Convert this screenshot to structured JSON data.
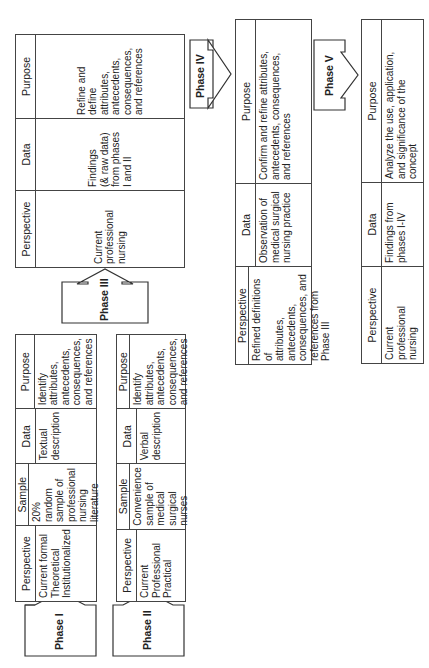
{
  "diagram": {
    "orientation": "rotated 90 degrees counter-clockwise",
    "phases": [
      {
        "label": "Phase I",
        "columns": [
          "Perspective",
          "Sample",
          "Data",
          "Purpose"
        ],
        "cells": [
          "Current formal\nTheoretical\nInstitutionalized",
          "20% random\nsample of\nprofessional\nnursing\nliterature",
          "Textual\ndescription",
          "Identify\nattributes,\nantecedents,\nconsequences,\nand references"
        ]
      },
      {
        "label": "Phase II",
        "columns": [
          "Perspective",
          "Sample",
          "Data",
          "Purpose"
        ],
        "cells": [
          "Current\nProfessional\nPractical",
          "Convenience\nsample of\nmedical\nsurgical\nnurses",
          "Verbal\ndescription",
          "Identify\nattributes,\nantecedents,\nconsequences,\nand references"
        ]
      },
      {
        "label": "Phase III",
        "columns": [
          "Perspective",
          "Data",
          "Purpose"
        ],
        "cells": [
          "Current\nprofessional\nnursing",
          "Findings\n(& raw data)\nfrom phases\nI and II",
          "Refine and\ndefine\nattributes,\nantecedents,\nconsequences,\nand references"
        ]
      },
      {
        "label": "Phase IV",
        "columns": [
          "Perspective",
          "Data",
          "Purpose"
        ],
        "cells": [
          "Refined definitions of\nattributes, antecedents,\nconsequences, and\nreferences from Phase III",
          "Observation of\nmedical surgical\nnursing practice",
          "Confirm and refine attributes,\nantecedents, consequences,\nand references"
        ]
      },
      {
        "label": "Phase V",
        "columns": [
          "Perspective",
          "Data",
          "Purpose"
        ],
        "cells": [
          "Current professional\nnursing",
          "Findings from\nphases I-IV",
          "Analyze the use, application,\nand significance of the\nconcept"
        ]
      }
    ]
  }
}
